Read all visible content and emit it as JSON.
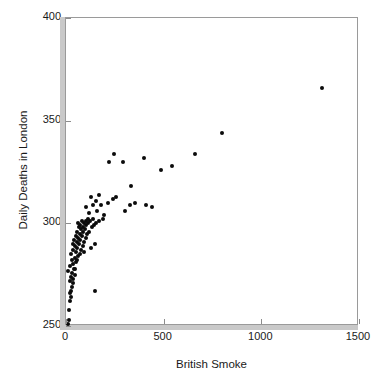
{
  "chart_data": {
    "type": "scatter",
    "title": "",
    "xlabel": "British Smoke",
    "ylabel": "Daily Deaths in London",
    "xlim": [
      0,
      1500
    ],
    "ylim": [
      250,
      400
    ],
    "xticks": [
      0,
      500,
      1000,
      1500
    ],
    "yticks": [
      250,
      300,
      350,
      400
    ],
    "xticklabels": [
      "0",
      "500",
      "1000",
      "1500"
    ],
    "yticklabels": [
      "250",
      "300",
      "350",
      "400"
    ],
    "grid": false,
    "legend": null,
    "marker": "circle",
    "marker_color": "#0b0b0b",
    "marker_size": 4,
    "series": [
      {
        "name": "Daily deaths vs British smoke",
        "points": [
          [
            10,
            251
          ],
          [
            14,
            253
          ],
          [
            16,
            258
          ],
          [
            20,
            262
          ],
          [
            24,
            264
          ],
          [
            18,
            266
          ],
          [
            28,
            267
          ],
          [
            30,
            269
          ],
          [
            34,
            271
          ],
          [
            22,
            272
          ],
          [
            38,
            273
          ],
          [
            26,
            274
          ],
          [
            44,
            275
          ],
          [
            32,
            276
          ],
          [
            12,
            277
          ],
          [
            40,
            278
          ],
          [
            48,
            278
          ],
          [
            20,
            279
          ],
          [
            36,
            280
          ],
          [
            52,
            281
          ],
          [
            30,
            282
          ],
          [
            58,
            282
          ],
          [
            44,
            283
          ],
          [
            150,
            267
          ],
          [
            62,
            284
          ],
          [
            26,
            285
          ],
          [
            70,
            285
          ],
          [
            50,
            286
          ],
          [
            38,
            287
          ],
          [
            78,
            287
          ],
          [
            56,
            288
          ],
          [
            46,
            289
          ],
          [
            86,
            289
          ],
          [
            64,
            290
          ],
          [
            34,
            290
          ],
          [
            94,
            291
          ],
          [
            54,
            291
          ],
          [
            72,
            292
          ],
          [
            42,
            292
          ],
          [
            102,
            293
          ],
          [
            62,
            293
          ],
          [
            80,
            294
          ],
          [
            50,
            294
          ],
          [
            110,
            295
          ],
          [
            70,
            295
          ],
          [
            88,
            296
          ],
          [
            58,
            296
          ],
          [
            120,
            296
          ],
          [
            78,
            297
          ],
          [
            96,
            297
          ],
          [
            66,
            298
          ],
          [
            132,
            298
          ],
          [
            86,
            298
          ],
          [
            104,
            299
          ],
          [
            74,
            299
          ],
          [
            144,
            299
          ],
          [
            94,
            300
          ],
          [
            112,
            300
          ],
          [
            60,
            300
          ],
          [
            156,
            300
          ],
          [
            102,
            301
          ],
          [
            124,
            301
          ],
          [
            82,
            301
          ],
          [
            170,
            301
          ],
          [
            112,
            302
          ],
          [
            136,
            302
          ],
          [
            190,
            302
          ],
          [
            92,
            286
          ],
          [
            126,
            288
          ],
          [
            146,
            290
          ],
          [
            118,
            305
          ],
          [
            160,
            306
          ],
          [
            104,
            308
          ],
          [
            136,
            309
          ],
          [
            178,
            309
          ],
          [
            152,
            311
          ],
          [
            196,
            304
          ],
          [
            128,
            313
          ],
          [
            214,
            310
          ],
          [
            170,
            314
          ],
          [
            240,
            312
          ],
          [
            258,
            313
          ],
          [
            300,
            306
          ],
          [
            330,
            309
          ],
          [
            352,
            310
          ],
          [
            410,
            309
          ],
          [
            440,
            308
          ],
          [
            335,
            318
          ],
          [
            245,
            334
          ],
          [
            218,
            330
          ],
          [
            292,
            330
          ],
          [
            398,
            332
          ],
          [
            488,
            326
          ],
          [
            542,
            328
          ],
          [
            662,
            334
          ],
          [
            800,
            344
          ],
          [
            1310,
            366
          ]
        ]
      }
    ]
  },
  "axes": {
    "y_title": "Daily Deaths in London",
    "x_title": "British Smoke"
  }
}
